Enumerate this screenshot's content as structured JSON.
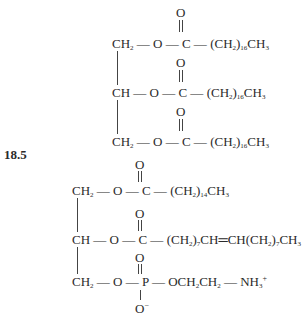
{
  "figure": {
    "problem_label": "18.5",
    "molecule_1": {
      "name": "triglyceride (tristearin)",
      "carbonyl_oxygen": "O",
      "rows": [
        {
          "backbone": "CH",
          "backbone_sub": "2",
          "link": " — O — C — ",
          "chain_pre": "(CH",
          "chain_sub1": "2",
          "chain_mid": ")",
          "chain_sub2": "16",
          "chain_post": "CH",
          "chain_sub3": "3"
        },
        {
          "backbone": "CH",
          "backbone_sub": "",
          "link": " — O — C — ",
          "chain_pre": "(CH",
          "chain_sub1": "2",
          "chain_mid": ")",
          "chain_sub2": "16",
          "chain_post": "CH",
          "chain_sub3": "3"
        },
        {
          "backbone": "CH",
          "backbone_sub": "2",
          "link": " — O — C — ",
          "chain_pre": "(CH",
          "chain_sub1": "2",
          "chain_mid": ")",
          "chain_sub2": "16",
          "chain_post": "CH",
          "chain_sub3": "3"
        }
      ]
    },
    "molecule_2": {
      "name": "phosphatidylethanolamine",
      "carbonyl_oxygen": "O",
      "row1": {
        "backbone": "CH",
        "backbone_sub": "2",
        "link": " — O — C — ",
        "chain_pre": "(CH",
        "chain_sub1": "2",
        "chain_mid": ")",
        "chain_sub2": "14",
        "chain_post": "CH",
        "chain_sub3": "3"
      },
      "row2": {
        "backbone": "CH",
        "link": " — O — C — ",
        "chain_a": "(CH",
        "chain_a_sub": "2",
        "chain_b": ")",
        "chain_b_sub": "7",
        "chain_c": "CH═CH(CH",
        "chain_c_sub": "2",
        "chain_d": ")",
        "chain_d_sub": "7",
        "chain_e": "CH",
        "chain_e_sub": "3"
      },
      "row3": {
        "backbone": "CH",
        "backbone_sub": "2",
        "link": " — O — P — ",
        "head_a": "OCH",
        "head_a_sub": "2",
        "head_b": "CH",
        "head_b_sub": "2",
        "head_c": " — NH",
        "head_c_sub": "3",
        "head_charge": "+",
        "phosphate_oxygen_top": "O",
        "phosphate_oxygen_bottom": "O",
        "phosphate_charge": "−"
      }
    }
  }
}
